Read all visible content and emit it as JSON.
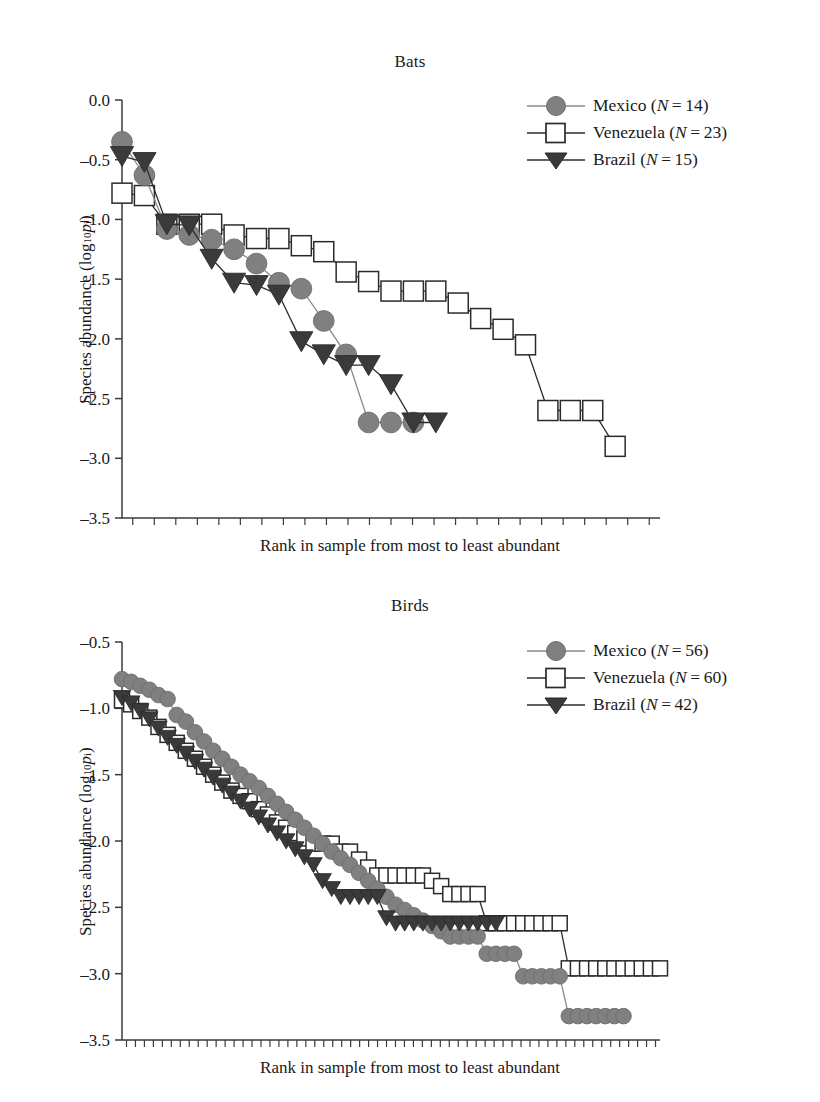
{
  "figure": {
    "panels": [
      {
        "id": "bats",
        "title": "Bats",
        "ylabel_main": "Species abundance (log",
        "ylabel_sub": "10",
        "ylabel_p": "p",
        "ylabel_i": "i",
        "ylabel_close": ")",
        "xlabel": "Rank in sample from most to least abundant",
        "yticks": [
          "0.0",
          "–0.5",
          "–1.0",
          "–1.5",
          "–2.0",
          "–2.5",
          "–3.0",
          "–3.5"
        ],
        "legend": [
          {
            "name": "mexico",
            "label": "Mexico (",
            "n_sym": "N",
            "n_eq": " = 14)",
            "marker": "circle",
            "color": "#808080"
          },
          {
            "name": "venezuela",
            "label": "Venezuela (",
            "n_sym": "N",
            "n_eq": " = 23)",
            "marker": "square",
            "color": "#ffffff"
          },
          {
            "name": "brazil",
            "label": "Brazil (",
            "n_sym": "N",
            "n_eq": " = 15)",
            "marker": "triangle",
            "color": "#3a3a3a"
          }
        ]
      },
      {
        "id": "birds",
        "title": "Birds",
        "ylabel_main": "Species abundance (log",
        "ylabel_sub": "10",
        "ylabel_p": "p",
        "ylabel_i": "i",
        "ylabel_close": ")",
        "xlabel": "Rank in sample from most to least abundant",
        "yticks": [
          "–0.5",
          "–1.0",
          "–1.5",
          "–2.0",
          "–2.5",
          "–3.0",
          "–3.5"
        ],
        "legend": [
          {
            "name": "mexico",
            "label": "Mexico (",
            "n_sym": "N",
            "n_eq": " = 56)",
            "marker": "circle",
            "color": "#808080"
          },
          {
            "name": "venezuela",
            "label": "Venezuela (",
            "n_sym": "N",
            "n_eq": " = 60)",
            "marker": "square",
            "color": "#ffffff"
          },
          {
            "name": "brazil",
            "label": "Brazil (",
            "n_sym": "N",
            "n_eq": " = 42)",
            "marker": "triangle",
            "color": "#3a3a3a"
          }
        ]
      }
    ]
  },
  "chart_data": [
    {
      "type": "line",
      "id": "bats",
      "title": "Bats",
      "xlabel": "Rank in sample from most to least abundant",
      "ylabel": "Species abundance (log10 pi)",
      "ylim": [
        -3.5,
        0.0
      ],
      "ytick_values": [
        0.0,
        -0.5,
        -1.0,
        -1.5,
        -2.0,
        -2.5,
        -3.0,
        -3.5
      ],
      "xlim": [
        1,
        25
      ],
      "grid": false,
      "legend_position": "top-right",
      "series": [
        {
          "name": "Mexico (N=14)",
          "marker": "circle",
          "color": "#808080",
          "x": [
            1,
            2,
            3,
            4,
            5,
            6,
            7,
            8,
            9,
            10,
            11,
            12,
            13,
            14
          ],
          "values": [
            -0.35,
            -0.63,
            -1.08,
            -1.13,
            -1.17,
            -1.25,
            -1.37,
            -1.53,
            -1.58,
            -1.85,
            -2.13,
            -2.7,
            -2.7,
            -2.7
          ]
        },
        {
          "name": "Venezuela (N=23)",
          "marker": "square",
          "color": "#ffffff",
          "x": [
            1,
            2,
            3,
            4,
            5,
            6,
            7,
            8,
            9,
            10,
            11,
            12,
            13,
            14,
            15,
            16,
            17,
            18,
            19,
            20,
            21,
            22,
            23
          ],
          "values": [
            -0.78,
            -0.8,
            -1.04,
            -1.04,
            -1.04,
            -1.13,
            -1.16,
            -1.16,
            -1.22,
            -1.27,
            -1.44,
            -1.52,
            -1.6,
            -1.6,
            -1.6,
            -1.7,
            -1.83,
            -1.92,
            -2.05,
            -2.6,
            -2.6,
            -2.6,
            -2.9
          ]
        },
        {
          "name": "Brazil (N=15)",
          "marker": "triangle",
          "color": "#3a3a3a",
          "x": [
            1,
            2,
            3,
            4,
            5,
            6,
            7,
            8,
            9,
            10,
            11,
            12,
            13,
            14,
            15
          ],
          "values": [
            -0.47,
            -0.52,
            -1.04,
            -1.05,
            -1.33,
            -1.53,
            -1.55,
            -1.63,
            -2.02,
            -2.13,
            -2.22,
            -2.22,
            -2.38,
            -2.7,
            -2.7
          ]
        }
      ]
    },
    {
      "type": "line",
      "id": "birds",
      "title": "Birds",
      "xlabel": "Rank in sample from most to least abundant",
      "ylabel": "Species abundance (log10 pi)",
      "ylim": [
        -3.5,
        -0.5
      ],
      "ytick_values": [
        -0.5,
        -1.0,
        -1.5,
        -2.0,
        -2.5,
        -3.0,
        -3.5
      ],
      "xlim": [
        1,
        60
      ],
      "grid": false,
      "legend_position": "top-right",
      "series": [
        {
          "name": "Mexico (N=56)",
          "marker": "circle",
          "color": "#808080",
          "x": [
            1,
            2,
            3,
            4,
            5,
            6,
            7,
            8,
            9,
            10,
            11,
            12,
            13,
            14,
            15,
            16,
            17,
            18,
            19,
            20,
            21,
            22,
            23,
            24,
            25,
            26,
            27,
            28,
            29,
            30,
            31,
            32,
            33,
            34,
            35,
            36,
            37,
            38,
            39,
            40,
            41,
            42,
            43,
            44,
            45,
            46,
            47,
            48,
            49,
            50,
            51,
            52,
            53,
            54,
            55,
            56
          ],
          "values": [
            -0.78,
            -0.8,
            -0.83,
            -0.86,
            -0.9,
            -0.93,
            -1.05,
            -1.1,
            -1.18,
            -1.25,
            -1.32,
            -1.38,
            -1.44,
            -1.5,
            -1.55,
            -1.6,
            -1.66,
            -1.72,
            -1.78,
            -1.84,
            -1.9,
            -1.96,
            -2.02,
            -2.08,
            -2.13,
            -2.18,
            -2.24,
            -2.3,
            -2.36,
            -2.42,
            -2.48,
            -2.52,
            -2.56,
            -2.6,
            -2.64,
            -2.68,
            -2.72,
            -2.72,
            -2.72,
            -2.72,
            -2.85,
            -2.85,
            -2.85,
            -2.85,
            -3.02,
            -3.02,
            -3.02,
            -3.02,
            -3.02,
            -3.32,
            -3.32,
            -3.32,
            -3.32,
            -3.32,
            -3.32,
            -3.32
          ]
        },
        {
          "name": "Venezuela (N=60)",
          "marker": "square",
          "color": "#ffffff",
          "x": [
            1,
            2,
            3,
            4,
            5,
            6,
            7,
            8,
            9,
            10,
            11,
            12,
            13,
            14,
            15,
            16,
            17,
            18,
            19,
            20,
            21,
            22,
            23,
            24,
            25,
            26,
            27,
            28,
            29,
            30,
            31,
            32,
            33,
            34,
            35,
            36,
            37,
            38,
            39,
            40,
            41,
            42,
            43,
            44,
            45,
            46,
            47,
            48,
            49,
            50,
            51,
            52,
            53,
            54,
            55,
            56,
            57,
            58,
            59,
            60
          ],
          "values": [
            -0.94,
            -0.97,
            -1.02,
            -1.07,
            -1.14,
            -1.2,
            -1.26,
            -1.32,
            -1.38,
            -1.44,
            -1.5,
            -1.56,
            -1.62,
            -1.66,
            -1.7,
            -1.76,
            -1.8,
            -1.86,
            -1.9,
            -1.94,
            -1.98,
            -2.02,
            -2.02,
            -2.02,
            -2.08,
            -2.08,
            -2.14,
            -2.2,
            -2.26,
            -2.26,
            -2.26,
            -2.26,
            -2.26,
            -2.26,
            -2.3,
            -2.34,
            -2.4,
            -2.4,
            -2.4,
            -2.4,
            -2.62,
            -2.62,
            -2.62,
            -2.62,
            -2.62,
            -2.62,
            -2.62,
            -2.62,
            -2.62,
            -2.96,
            -2.96,
            -2.96,
            -2.96,
            -2.96,
            -2.96,
            -2.96,
            -2.96,
            -2.96,
            -2.96,
            -2.96
          ]
        },
        {
          "name": "Brazil (N=42)",
          "marker": "triangle",
          "color": "#3a3a3a",
          "x": [
            1,
            2,
            3,
            4,
            5,
            6,
            7,
            8,
            9,
            10,
            11,
            12,
            13,
            14,
            15,
            16,
            17,
            18,
            19,
            20,
            21,
            22,
            23,
            24,
            25,
            26,
            27,
            28,
            29,
            30,
            31,
            32,
            33,
            34,
            35,
            36,
            37,
            38,
            39,
            40,
            41,
            42
          ],
          "values": [
            -0.92,
            -0.96,
            -1.02,
            -1.08,
            -1.15,
            -1.22,
            -1.28,
            -1.34,
            -1.4,
            -1.46,
            -1.52,
            -1.58,
            -1.64,
            -1.7,
            -1.76,
            -1.82,
            -1.88,
            -1.94,
            -2.0,
            -2.06,
            -2.12,
            -2.18,
            -2.3,
            -2.36,
            -2.42,
            -2.42,
            -2.42,
            -2.42,
            -2.42,
            -2.58,
            -2.62,
            -2.62,
            -2.62,
            -2.62,
            -2.62,
            -2.62,
            -2.62,
            -2.62,
            -2.62,
            -2.62,
            -2.62,
            -2.62
          ]
        }
      ]
    }
  ]
}
